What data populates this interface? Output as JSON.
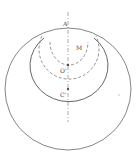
{
  "diagram": {
    "labels": {
      "A": "A",
      "M": "M",
      "O": "O'",
      "C": "C'"
    },
    "colors": {
      "line": "#666666",
      "dashed": "#777777",
      "background": "#ffffff"
    }
  }
}
